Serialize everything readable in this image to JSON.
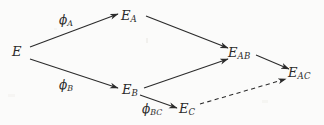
{
  "diagram": {
    "type": "commutative-diagram",
    "background_color": "#fbfbfa",
    "ink_color": "#2b2b2b",
    "nodes": [
      {
        "id": "E",
        "base": "E",
        "sub": "",
        "x": 18,
        "y": 52
      },
      {
        "id": "E_A",
        "base": "E",
        "sub": "A",
        "x": 130,
        "y": 16
      },
      {
        "id": "E_B",
        "base": "E",
        "sub": "B",
        "x": 131,
        "y": 90
      },
      {
        "id": "E_C",
        "base": "E",
        "sub": "C",
        "x": 188,
        "y": 109
      },
      {
        "id": "E_AB",
        "base": "E",
        "sub": "AB",
        "x": 241,
        "y": 53
      },
      {
        "id": "E_AC",
        "base": "E",
        "sub": "AC",
        "x": 302,
        "y": 73
      }
    ],
    "edges": [
      {
        "id": "E-to-EA",
        "from": "E",
        "to": "E_A",
        "style": "solid",
        "label_base": "ϕ",
        "label_sub": "A",
        "label_x": 68,
        "label_y": 21
      },
      {
        "id": "E-to-EB",
        "from": "E",
        "to": "E_B",
        "style": "solid",
        "label_base": "ϕ",
        "label_sub": "B",
        "label_x": 68,
        "label_y": 86
      },
      {
        "id": "EA-to-EAB",
        "from": "E_A",
        "to": "E_AB",
        "style": "solid",
        "label_base": "",
        "label_sub": "",
        "label_x": 0,
        "label_y": 0
      },
      {
        "id": "EB-to-EAB",
        "from": "E_B",
        "to": "E_AB",
        "style": "solid",
        "label_base": "",
        "label_sub": "",
        "label_x": 0,
        "label_y": 0
      },
      {
        "id": "EB-to-EC",
        "from": "E_B",
        "to": "E_C",
        "style": "solid",
        "label_base": "ϕ",
        "label_sub": "BC",
        "label_x": 145,
        "label_y": 110
      },
      {
        "id": "EAB-to-EAC",
        "from": "E_AB",
        "to": "E_AC",
        "style": "solid",
        "label_base": "",
        "label_sub": "",
        "label_x": 0,
        "label_y": 0
      },
      {
        "id": "EC-to-EAC",
        "from": "E_C",
        "to": "E_AC",
        "style": "dashed",
        "label_base": "",
        "label_sub": "",
        "label_x": 0,
        "label_y": 0
      }
    ]
  },
  "labels": {
    "node_E": {
      "base": "E",
      "sub": ""
    },
    "node_EA": {
      "base": "E",
      "sub": "A"
    },
    "node_EB": {
      "base": "E",
      "sub": "B"
    },
    "node_EC": {
      "base": "E",
      "sub": "C"
    },
    "node_EAB": {
      "base": "E",
      "sub": "AB"
    },
    "node_EAC": {
      "base": "E",
      "sub": "AC"
    },
    "edge_phiA": {
      "base": "ϕ",
      "sub": "A"
    },
    "edge_phiB": {
      "base": "ϕ",
      "sub": "B"
    },
    "edge_phiBC": {
      "base": "ϕ",
      "sub": "BC"
    }
  }
}
